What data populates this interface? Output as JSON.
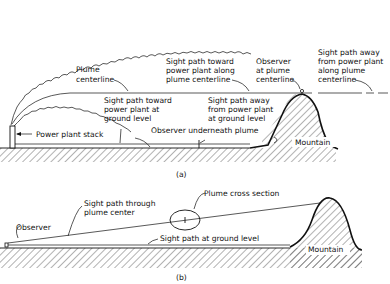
{
  "panel_a": {
    "caption": "(a)",
    "labels": {
      "plume_centerline": [
        "Plume",
        "centerline"
      ],
      "sight_toward_ground": [
        "Sight path toward",
        "power plant at",
        "ground level"
      ],
      "sight_toward_centerline": [
        "Sight path toward",
        "power plant along",
        "plume centerline"
      ],
      "observer_at_centerline": [
        "Observer",
        "at plume",
        "centerline"
      ],
      "sight_away_centerline": [
        "Sight path away",
        "from power plant",
        "along plume",
        "centerline"
      ],
      "sight_away_ground": [
        "Sight path away",
        "from power plant",
        "at ground level"
      ],
      "power_plant_stack": "Power plant stack",
      "observer_underneath": "Observer underneath plume",
      "mountain": "Mountain"
    }
  },
  "panel_b": {
    "caption": "(b)",
    "labels": {
      "observer": "Observer",
      "sight_through_center": [
        "Sight path through",
        "plume center"
      ],
      "plume_cross_section": "Plume cross section",
      "sight_ground": "Sight path at ground level",
      "mountain": "Mountain"
    }
  },
  "colors": {
    "ink": "#111111",
    "background": "#ffffff"
  }
}
